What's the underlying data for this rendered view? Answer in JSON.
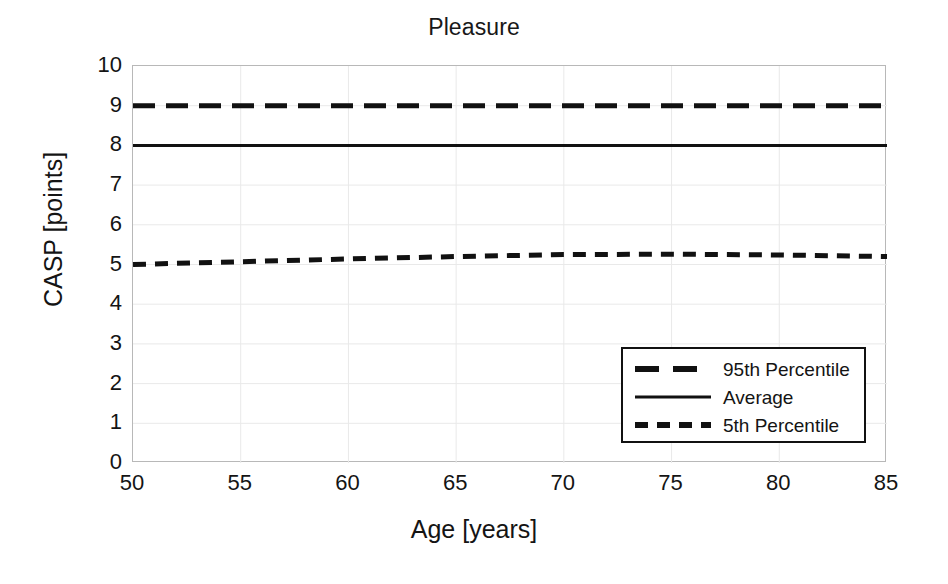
{
  "chart_data": {
    "type": "line",
    "title": "Pleasure",
    "xlabel": "Age [years]",
    "ylabel": "CASP [points]",
    "xlim": [
      50,
      85
    ],
    "ylim": [
      0,
      10
    ],
    "xticks": [
      50,
      55,
      60,
      65,
      70,
      75,
      80,
      85
    ],
    "yticks": [
      0,
      1,
      2,
      3,
      4,
      5,
      6,
      7,
      8,
      9,
      10
    ],
    "grid": true,
    "legend_position": "lower right",
    "x": [
      50,
      55,
      60,
      65,
      70,
      75,
      80,
      85
    ],
    "series": [
      {
        "name": "95th Percentile",
        "style": "long-dashed",
        "color": "#111111",
        "values": [
          9.0,
          9.0,
          9.0,
          9.0,
          9.0,
          9.0,
          9.0,
          9.0
        ]
      },
      {
        "name": "Average",
        "style": "solid",
        "color": "#111111",
        "values": [
          8.0,
          8.0,
          8.0,
          8.0,
          8.0,
          8.0,
          8.0,
          8.0
        ]
      },
      {
        "name": "5th Percentile",
        "style": "short-dashed",
        "color": "#111111",
        "values": [
          5.0,
          5.07,
          5.14,
          5.2,
          5.25,
          5.26,
          5.24,
          5.2
        ]
      }
    ]
  },
  "legend": {
    "items": [
      {
        "label": "95th Percentile",
        "sample": "long-dash-line-icon"
      },
      {
        "label": "Average",
        "sample": "solid-line-icon"
      },
      {
        "label": "5th Percentile",
        "sample": "short-dash-line-icon"
      }
    ]
  },
  "axes": {
    "y_tick_labels": [
      "10",
      "9",
      "8",
      "7",
      "6",
      "5",
      "4",
      "3",
      "2",
      "1",
      "0"
    ],
    "x_tick_labels": [
      "50",
      "55",
      "60",
      "65",
      "70",
      "75",
      "80",
      "85"
    ]
  }
}
